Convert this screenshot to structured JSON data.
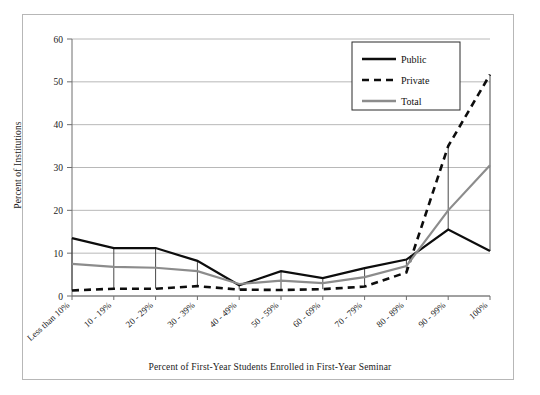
{
  "figure": {
    "frame_border_color": "#b7b7b7",
    "background": "#ffffff"
  },
  "chart_data": {
    "type": "line",
    "title": "",
    "xlabel": "Percent of First-Year Students Enrolled in First-Year Seminar",
    "ylabel": "Percent of Institutions",
    "categories": [
      "Less than 10%",
      "10 - 19%",
      "20 - 29%",
      "30 - 39%",
      "40 - 49%",
      "50 - 59%",
      "60 - 69%",
      "70 - 79%",
      "80 - 89%",
      "90 - 99%",
      "100%"
    ],
    "series": [
      {
        "name": "Public",
        "color": "#0d0d0d",
        "style": "solid",
        "values": [
          13.5,
          11.2,
          11.2,
          8.2,
          2.5,
          5.8,
          4.2,
          6.5,
          8.5,
          15.5,
          10.5
        ]
      },
      {
        "name": "Private",
        "color": "#0d0d0d",
        "style": "dashed",
        "values": [
          1.3,
          1.7,
          1.7,
          2.3,
          1.5,
          1.4,
          1.6,
          2.2,
          5.5,
          35.0,
          51.7
        ]
      },
      {
        "name": "Total",
        "color": "#8c8c8c",
        "style": "solid",
        "values": [
          7.5,
          6.8,
          6.6,
          5.8,
          2.8,
          3.6,
          3.0,
          4.4,
          7.0,
          20.0,
          30.5
        ]
      }
    ],
    "ylim": [
      0,
      60
    ],
    "yticks": [
      0,
      10,
      20,
      30,
      40,
      50,
      60
    ],
    "ytick_labels": [
      "0",
      "10",
      "20",
      "30",
      "40",
      "50",
      "60"
    ],
    "grid": true,
    "grid_color": "#a6a6a6",
    "legend_position": "top-right",
    "droplines": true
  },
  "legend": {
    "entries": [
      {
        "label": "Public"
      },
      {
        "label": "Private"
      },
      {
        "label": "Total"
      }
    ]
  }
}
